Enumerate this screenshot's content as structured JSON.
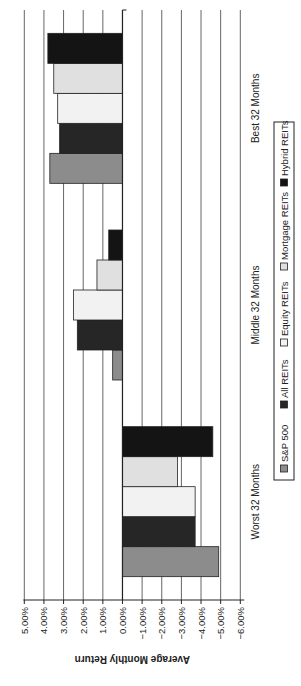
{
  "chart_data": {
    "type": "bar",
    "orientation": "vertical",
    "display_rotation": "rotated 90 degrees counterclockwise on the page",
    "title": "",
    "xlabel": "",
    "ylabel": "Average Monthly Return",
    "categories": [
      "Worst 32 Months",
      "Middle 32 Months",
      "Best 32 Months"
    ],
    "series": [
      {
        "name": "S&P 500",
        "color": "#8c8c8c",
        "values": [
          -4.9,
          0.5,
          3.7
        ]
      },
      {
        "name": "All REITs",
        "color": "#262626",
        "values": [
          -3.7,
          2.3,
          3.2
        ]
      },
      {
        "name": "Equity REITs",
        "color": "#f2f2f2",
        "values": [
          -3.7,
          2.5,
          3.3
        ]
      },
      {
        "name": "Mortgage REITs",
        "color": "#e0e0e0",
        "values": [
          -2.8,
          1.3,
          3.5
        ]
      },
      {
        "name": "Hybrid REITs",
        "color": "#141414",
        "values": [
          -4.6,
          0.7,
          3.8
        ]
      }
    ],
    "ylim": [
      -6,
      5
    ],
    "yticks": [
      5,
      4,
      3,
      2,
      1,
      0,
      -1,
      -2,
      -3,
      -4,
      -5,
      -6
    ],
    "ytick_labels": [
      "5.00%",
      "4.00%",
      "3.00%",
      "2.00%",
      "1.00%",
      "0.00%",
      "−1.00%",
      "−2.00%",
      "−3.00%",
      "−4.00%",
      "−5.00%",
      "−6.00%"
    ],
    "grid": "horizontal gridlines at every tick",
    "legend": {
      "placement": "bottom",
      "entries": [
        "S&P 500",
        "All REITs",
        "Equity REITs",
        "Mortgage REITs",
        "Hybrid REITs"
      ]
    }
  }
}
